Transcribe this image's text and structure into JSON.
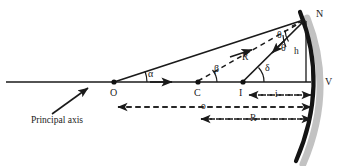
{
  "figure": {
    "type": "ray-diagram",
    "width": 346,
    "height": 166,
    "background_color": "#ffffff",
    "ink_color": "#1a1a1a",
    "shadow_color": "#b8b8b8"
  },
  "caption": {
    "principal_axis": "Principal axis"
  },
  "points": [
    {
      "id": "O",
      "label": "O",
      "role": "object-point",
      "x": 114,
      "y": 82
    },
    {
      "id": "C",
      "label": "C",
      "role": "center-of-curvature",
      "x": 198,
      "y": 82
    },
    {
      "id": "I",
      "label": "I",
      "role": "image-point",
      "x": 243,
      "y": 82
    },
    {
      "id": "V",
      "label": "V",
      "role": "vertex-pole",
      "x": 310,
      "y": 82
    },
    {
      "id": "N",
      "label": "N",
      "role": "reflection-point",
      "x": 306,
      "y": 19
    }
  ],
  "angles": [
    {
      "id": "alpha",
      "label": "α",
      "vertex": "O",
      "desc": "angle at object point"
    },
    {
      "id": "beta",
      "label": "β",
      "vertex": "C",
      "desc": "angle at center of curvature"
    },
    {
      "id": "theta_incident",
      "label": "θ",
      "vertex": "N",
      "desc": "angle of incidence"
    },
    {
      "id": "theta_reflected",
      "label": "θ",
      "vertex": "N",
      "desc": "angle of reflection"
    },
    {
      "id": "delta",
      "label": "δ",
      "vertex": "I",
      "desc": "angle at image point"
    }
  ],
  "segments": [
    {
      "id": "radius",
      "label": "R",
      "from": "C",
      "to": "N",
      "style": "dashed",
      "desc": "radius of curvature"
    },
    {
      "id": "height",
      "label": "h",
      "from": "N",
      "to": "V-foot",
      "style": "solid",
      "desc": "perpendicular height of reflection point"
    }
  ],
  "dimensions": [
    {
      "id": "image-distance",
      "label": "i",
      "from": "I",
      "to": "V",
      "style": "dashed-double-arrow"
    },
    {
      "id": "object-distance",
      "label": "o",
      "from": "O",
      "to": "V",
      "style": "dashed-double-arrow"
    },
    {
      "id": "radius-distance",
      "label": "R",
      "from": "C",
      "to": "V",
      "style": "dashed-double-arrow"
    }
  ],
  "rays": [
    {
      "id": "incident-ray",
      "from": "O",
      "to": "N",
      "style": "solid-arrow"
    },
    {
      "id": "reflected-ray",
      "from": "N",
      "to": "I",
      "style": "solid-arrow"
    },
    {
      "id": "axis-ray",
      "from": "O",
      "to": "V",
      "style": "solid-arrow"
    }
  ],
  "mirror": {
    "id": "concave-mirror",
    "shape": "arc",
    "desc": "thick concave mirror arc with drop shadow"
  }
}
